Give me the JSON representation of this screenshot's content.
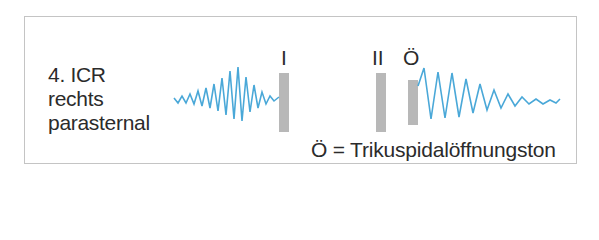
{
  "figure": {
    "location_label_lines": [
      "4. ICR",
      "rechts",
      "parasternal"
    ],
    "markers": [
      {
        "id": "first-heart-sound",
        "label": "I",
        "x": 279,
        "y": 73,
        "w": 10,
        "h": 59
      },
      {
        "id": "second-heart-sound",
        "label": "II",
        "x": 376,
        "y": 73,
        "w": 10,
        "h": 59
      },
      {
        "id": "tricuspid-opening-snap",
        "label": "Ö",
        "x": 408,
        "y": 80,
        "w": 10,
        "h": 45
      }
    ],
    "legend": "Ö = Trikuspidalöffnungston",
    "colors": {
      "waveform": "#4aa8d8",
      "bar": "#b8b8b8",
      "frame": "#c4c4c4",
      "text": "#2b2b2b"
    },
    "waveforms": [
      {
        "name": "crescendo-decrescendo-murmur",
        "points": "174,98 178,103 182,96 186,103 190,94 194,104 198,91 202,106 206,88 210,108 214,84 218,111 222,78 226,115 230,71 234,119 238,67 242,121 246,77 250,112 254,85 258,108 262,92 266,104 270,96 274,101 279,97"
      },
      {
        "name": "diastolic-murmur-after-opening-snap",
        "points": "418,86 424,68 431,119 438,72 445,118 452,73 459,117 466,79 473,113 480,84 487,110 494,90 501,108 508,94 515,106 522,97 529,104 536,99 543,104 550,100 556,103 560,99"
      }
    ]
  }
}
